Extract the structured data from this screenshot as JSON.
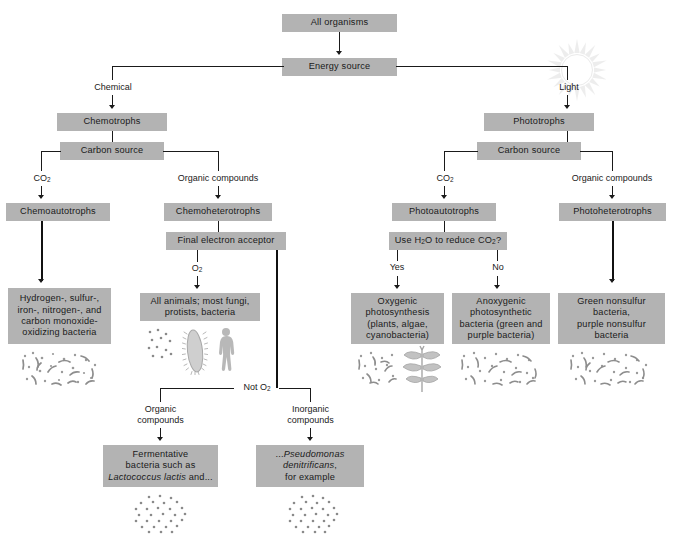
{
  "colors": {
    "box_fill": "#b3b3b3",
    "box_fill_light": "#bdbdbd",
    "line": "#1a1a1a",
    "background": "#ffffff",
    "art_gray": "#b9b9b9"
  },
  "boxes": {
    "all_organisms": "All organisms",
    "energy_source": "Energy source",
    "chemotrophs": "Chemotrophs",
    "carbon_source_left": "Carbon source",
    "chemoautotrophs": "Chemoautotrophs",
    "chemoheterotrophs": "Chemoheterotrophs",
    "final_electron_acceptor": "Final electron acceptor",
    "phototrophs": "Phototrophs",
    "carbon_source_right": "Carbon source",
    "photoautotrophs": "Photoautotrophs",
    "photoheterotrophs": "Photoheterotrophs",
    "use_water_question": "Use H<sub>2</sub>O to reduce CO<sub>2</sub>?",
    "chemoautotroph_examples": "Hydrogen-, sulfur-,<br>iron-, nitrogen-, and<br>carbon monoxide-<br>oxidizing bacteria",
    "aerobic_examples": "All animals; most fungi,<br>protists, bacteria",
    "fermentative_examples": "Fermentative<br>bacteria such as<br><span class=\"ital\">Lactococcus lactis</span> and...",
    "anaerobic_respiration_examples": "...<span class=\"ital\">Pseudomonas<br>denitrificans</span>,<br>for example",
    "oxygenic_examples": "Oxygenic<br>photosynthesis<br>(plants, algae,<br>cyanobacteria)",
    "anoxygenic_examples": "Anoxygenic<br>photosynthetic<br>bacteria (green and<br>purple bacteria)",
    "photoheterotroph_examples": "Green nonsulfur<br>bacteria,<br>purple nonsulfur<br>bacteria"
  },
  "edge_labels": {
    "chemical": "Chemical",
    "light": "Light",
    "co2_left": "CO<sub>2</sub>",
    "organic_compounds_left": "Organic compounds",
    "co2_right": "CO<sub>2</sub>",
    "organic_compounds_right": "Organic compounds",
    "o2": "O<sub>2</sub>",
    "not_o2": "Not O<sub>2</sub>",
    "organic_compounds_branch": "Organic<br>compounds",
    "inorganic_compounds_branch": "Inorganic<br>compounds",
    "yes": "Yes",
    "no": "No"
  },
  "icons": {
    "sun": "sun-icon",
    "bacteria_chemoautotroph": "bacteria-cluster-icon",
    "bacteria_aerobic": "bacteria-dots-icon",
    "paramecium": "paramecium-icon",
    "human": "human-figure-icon",
    "bacteria_fermentative": "bacteria-dots-icon",
    "bacteria_anaerobic": "bacteria-dots-icon",
    "bacteria_oxygenic": "bacteria-cluster-icon",
    "plant": "plant-icon",
    "bacteria_anoxygenic": "bacteria-cluster-icon",
    "bacteria_photoheterotroph": "bacteria-cluster-icon"
  }
}
